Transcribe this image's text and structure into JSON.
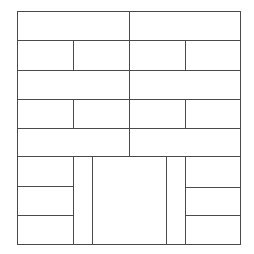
{
  "diagram": {
    "type": "rectangular-panel-layout",
    "line_color": "#4a4a4a",
    "background_color": "#ffffff",
    "bounds": {
      "x1": 17,
      "y1": 11,
      "x2": 240,
      "y2": 244
    },
    "rows": [
      {
        "name": "row-1",
        "y1": 11,
        "y2": 40,
        "cells": [
          [
            17,
            129
          ],
          [
            129,
            240
          ]
        ]
      },
      {
        "name": "row-2",
        "y1": 40,
        "y2": 70,
        "cells": [
          [
            17,
            73
          ],
          [
            73,
            129
          ],
          [
            129,
            185
          ],
          [
            185,
            240
          ]
        ]
      },
      {
        "name": "row-3",
        "y1": 70,
        "y2": 99,
        "cells": [
          [
            17,
            129
          ],
          [
            129,
            240
          ]
        ]
      },
      {
        "name": "row-4",
        "y1": 99,
        "y2": 128,
        "cells": [
          [
            17,
            73
          ],
          [
            73,
            129
          ],
          [
            129,
            185
          ],
          [
            185,
            240
          ]
        ]
      },
      {
        "name": "row-5",
        "y1": 128,
        "y2": 156,
        "cells": [
          [
            17,
            129
          ],
          [
            129,
            240
          ]
        ]
      }
    ],
    "bottom_section": {
      "y1": 156,
      "y2": 244,
      "left_stack": {
        "x1": 17,
        "x2": 73,
        "dividers_y": [
          186,
          215
        ]
      },
      "left_narrow_column": {
        "x1": 73,
        "x2": 92
      },
      "center_panel": {
        "x1": 92,
        "x2": 166
      },
      "right_narrow_column": {
        "x1": 166,
        "x2": 185
      },
      "right_stack": {
        "x1": 185,
        "x2": 240,
        "dividers_y": [
          187,
          215
        ]
      }
    }
  }
}
